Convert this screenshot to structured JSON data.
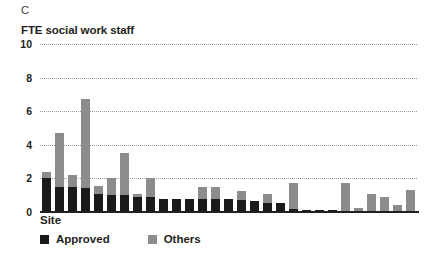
{
  "panel": {
    "letter": "C"
  },
  "legend": {
    "items": [
      {
        "label": "Approved",
        "color": "#1a1a1a",
        "swatch": "approved"
      },
      {
        "label": "Others",
        "color": "#8c8c8c",
        "swatch": "others"
      }
    ]
  },
  "chart_data": {
    "type": "bar",
    "stacked": true,
    "title": "FTE social work staff",
    "xlabel": "Site",
    "ylabel": "FTE social work staff",
    "ylim": [
      0,
      10
    ],
    "yticks": [
      10,
      8,
      6,
      4,
      2,
      0
    ],
    "ytick_labels": [
      "10",
      "8",
      "6",
      "4",
      "2",
      "0"
    ],
    "grid": true,
    "grid_axis": "y",
    "legend_position": "bottom-left",
    "xtick_labels": [],
    "categories": [
      "Site 1",
      "Site 2",
      "Site 3",
      "Site 4",
      "Site 5",
      "Site 6",
      "Site 7",
      "Site 8",
      "Site 9",
      "Site 10",
      "Site 11",
      "Site 12",
      "Site 13",
      "Site 14",
      "Site 15",
      "Site 16",
      "Site 17",
      "Site 18",
      "Site 19",
      "Site 20",
      "Site 21",
      "Site 22",
      "Site 23",
      "Site 24",
      "Site 25",
      "Site 26",
      "Site 27",
      "Site 28",
      "Site 29"
    ],
    "series": [
      {
        "name": "Approved",
        "color": "#1a1a1a",
        "values": [
          2.0,
          1.5,
          1.5,
          1.45,
          1.1,
          1.0,
          1.0,
          0.9,
          0.9,
          0.8,
          0.8,
          0.8,
          0.8,
          0.8,
          0.8,
          0.7,
          0.65,
          0.55,
          0.55,
          0.2,
          0.1,
          0.1,
          0.1,
          0.05,
          0.0,
          0.05,
          0.0,
          0.0,
          0.0
        ]
      },
      {
        "name": "Others",
        "color": "#8c8c8c",
        "values": [
          0.4,
          3.2,
          0.7,
          5.3,
          0.45,
          1.0,
          2.5,
          0.15,
          1.1,
          0.0,
          0.0,
          0.0,
          0.7,
          0.7,
          0.0,
          0.55,
          0.0,
          0.5,
          0.0,
          1.5,
          0.0,
          0.0,
          0.0,
          1.7,
          0.25,
          1.05,
          0.9,
          0.4,
          1.3
        ]
      }
    ],
    "totals": [
      2.4,
      4.7,
      2.2,
      6.75,
      1.55,
      2.0,
      3.5,
      1.05,
      2.0,
      0.8,
      0.8,
      0.8,
      1.5,
      1.5,
      0.8,
      1.25,
      0.65,
      1.05,
      0.55,
      1.7,
      0.1,
      0.1,
      0.1,
      1.75,
      0.25,
      1.1,
      0.9,
      0.4,
      1.3
    ]
  }
}
